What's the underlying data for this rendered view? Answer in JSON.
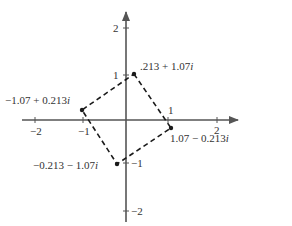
{
  "diagram": {
    "type": "complex-plane",
    "colors": {
      "axis": "#555555",
      "edge": "#1a1a1a",
      "text": "#333333",
      "background": "#ffffff"
    },
    "axes": {
      "x_ticks": [
        {
          "value": -2,
          "label": "−2"
        },
        {
          "value": -1,
          "label": "−1"
        },
        {
          "value": 1,
          "label": "1"
        },
        {
          "value": 2,
          "label": "2"
        }
      ],
      "y_ticks": [
        {
          "value": 2,
          "label": "2"
        },
        {
          "value": 1,
          "label": "1"
        },
        {
          "value": -1,
          "label": "−1"
        },
        {
          "value": -2,
          "label": "−2"
        }
      ]
    },
    "vertices": [
      {
        "re": 0.213,
        "im": 1.07,
        "label_prefix": ".213 + 1.07",
        "label_suffix": "i"
      },
      {
        "re": 1.07,
        "im": -0.213,
        "label_prefix": "1.07 − 0.213",
        "label_suffix": "i"
      },
      {
        "re": -0.213,
        "im": -1.07,
        "label_prefix": "−0.213 − 1.07",
        "label_suffix": "i"
      },
      {
        "re": -1.07,
        "im": 0.213,
        "label_prefix": "−1.07 + 0.213",
        "label_suffix": "i"
      }
    ]
  }
}
